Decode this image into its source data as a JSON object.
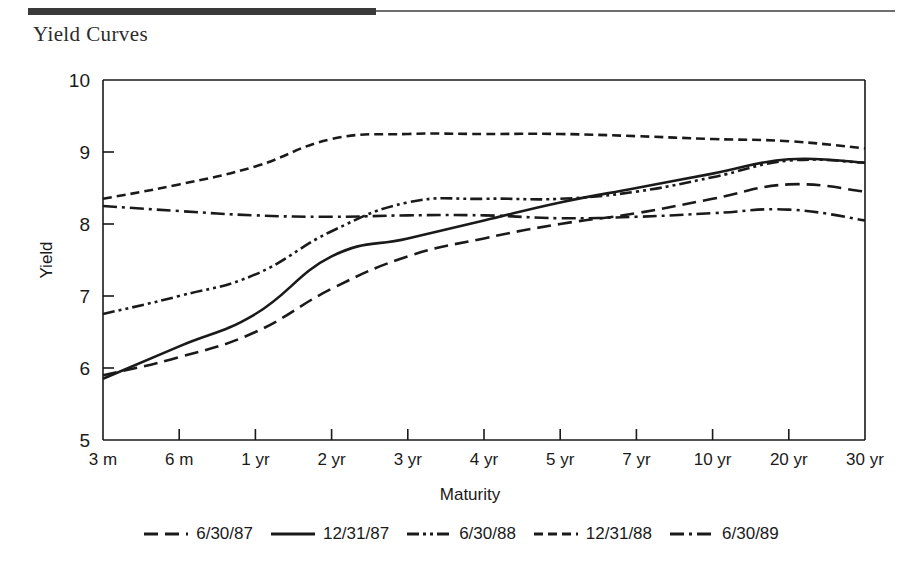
{
  "document": {
    "heading": "Yield Curves",
    "rule_color": "#3a3a3a"
  },
  "chart_data": {
    "type": "line",
    "title": "Yield Curves",
    "xlabel": "Maturity",
    "ylabel": "Yield",
    "categories": [
      "3 m",
      "6 m",
      "1 yr",
      "2 yr",
      "3 yr",
      "4 yr",
      "5 yr",
      "7 yr",
      "10 yr",
      "20 yr",
      "30 yr"
    ],
    "ylim": [
      5,
      10
    ],
    "yticks": [
      5,
      6,
      7,
      8,
      9,
      10
    ],
    "ytick_labels": [
      "5",
      "6",
      "7",
      "8",
      "9",
      "10"
    ],
    "grid": false,
    "legend_position": "bottom",
    "line_color": "#1a1a1a",
    "series": [
      {
        "name": "6/30/87",
        "style": "long-dash",
        "dasharray": "14,7",
        "values": [
          5.9,
          6.15,
          6.5,
          7.1,
          7.55,
          7.8,
          8.0,
          8.15,
          8.35,
          8.55,
          8.45
        ]
      },
      {
        "name": "12/31/87",
        "style": "solid",
        "dasharray": "none",
        "values": [
          5.85,
          6.3,
          6.75,
          7.55,
          7.8,
          8.05,
          8.3,
          8.5,
          8.7,
          8.9,
          8.85
        ]
      },
      {
        "name": "6/30/88",
        "style": "dash-dot-dot",
        "dasharray": "12,4,3,4,3,4",
        "values": [
          6.75,
          7.0,
          7.3,
          7.9,
          8.3,
          8.35,
          8.35,
          8.45,
          8.65,
          8.88,
          8.85
        ]
      },
      {
        "name": "12/31/88",
        "style": "short-dash",
        "dasharray": "9,5",
        "values": [
          8.35,
          8.55,
          8.8,
          9.18,
          9.25,
          9.25,
          9.25,
          9.22,
          9.18,
          9.15,
          9.05
        ]
      },
      {
        "name": "6/30/89",
        "style": "dash-dot",
        "dasharray": "14,5,3,5",
        "values": [
          8.25,
          8.18,
          8.12,
          8.1,
          8.12,
          8.12,
          8.08,
          8.1,
          8.15,
          8.2,
          8.05
        ]
      }
    ]
  },
  "axes": {
    "y_axis_label": "Yield",
    "x_axis_label": "Maturity"
  }
}
